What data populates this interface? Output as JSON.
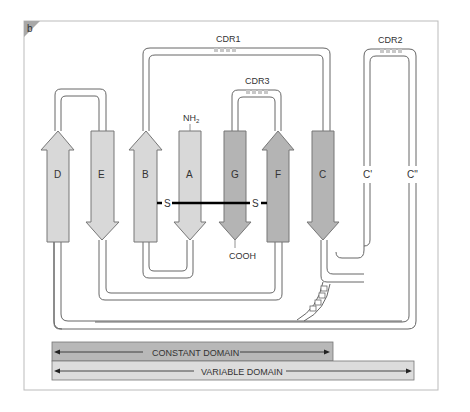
{
  "panel_label": "b",
  "colors": {
    "light_strand": "#d8d8d8",
    "dark_strand": "#b4b4b4",
    "constant_bar": "#b8b8b8",
    "variable_bar": "#dcdcdc",
    "outline": "#666666",
    "frame": "#bbbbbb",
    "disulfide": "#000000"
  },
  "strands": [
    {
      "id": "D",
      "label": "D",
      "direction": "up",
      "shade": "light"
    },
    {
      "id": "E",
      "label": "E",
      "direction": "down",
      "shade": "light"
    },
    {
      "id": "B",
      "label": "B",
      "direction": "up",
      "shade": "light"
    },
    {
      "id": "A",
      "label": "A",
      "direction": "down",
      "shade": "light"
    },
    {
      "id": "G",
      "label": "G",
      "direction": "down",
      "shade": "dark"
    },
    {
      "id": "F",
      "label": "F",
      "direction": "up",
      "shade": "dark"
    },
    {
      "id": "C",
      "label": "C",
      "direction": "down",
      "shade": "dark"
    },
    {
      "id": "C1",
      "label": "C'",
      "direction": "none",
      "shade": "none"
    },
    {
      "id": "C2",
      "label": "C\"",
      "direction": "none",
      "shade": "none"
    }
  ],
  "cdrs": [
    {
      "id": "CDR1",
      "label": "CDR1"
    },
    {
      "id": "CDR2",
      "label": "CDR2"
    },
    {
      "id": "CDR3",
      "label": "CDR3"
    }
  ],
  "termini": {
    "n_terminus": "NH2",
    "n_sub": "2",
    "n_main": "NH",
    "c_terminus": "COOH"
  },
  "disulfide": {
    "left": "S",
    "right": "S"
  },
  "domains": {
    "constant": "CONSTANT DOMAIN",
    "variable": "VARIABLE DOMAIN"
  }
}
